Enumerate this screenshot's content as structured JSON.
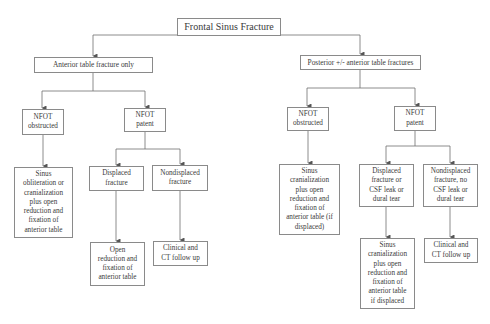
{
  "diagram": {
    "type": "flowchart",
    "title": "Frontal Sinus Fracture",
    "nodes": {
      "root": "Frontal Sinus Fracture",
      "anterior_only": "Anterior table fracture only",
      "posterior": "Posterior +/- anterior table fractures",
      "a_nfot_obstructed": "NFOT\nobstructed",
      "a_nfot_patent": "NFOT\npatent",
      "a_obstructed_tx": "Sinus\nobliteration or\ncranialization\nplus open\nreduction and\nfixation of\nanterior table",
      "a_displaced": "Displaced\nfracture",
      "a_nondisplaced": "Nondisplaced\nfracture",
      "a_displaced_tx": "Open\nreduction and\nfixation of\nanterior table",
      "a_nondisplaced_tx": "Clinical and\nCT follow up",
      "p_nfot_obstructed": "NFOT\nobstructed",
      "p_nfot_patent": "NFOT\npatent",
      "p_obstructed_tx": "Sinus\ncranialization\nplus open\nreduction and\nfixation of\nanterior table (if\ndisplaced)",
      "p_displaced": "Displaced\nfracture or\nCSF leak or\ndural tear",
      "p_nondisplaced": "Nondisplaced\nfracture, no\nCSF leak or\ndural tear",
      "p_displaced_tx": "Sinus\ncranialization\nplus open\nreduction and\nfixation of\nanterior table\nif displaced",
      "p_nondisplaced_tx": "Clinical and\nCT follow up"
    },
    "colors": {
      "line": "#6e6e6e",
      "border": "#8a8a8a",
      "text": "#3a3a3a"
    }
  }
}
